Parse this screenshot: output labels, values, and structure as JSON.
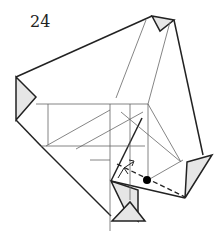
{
  "diagram": {
    "type": "origami-step",
    "step_number": "24",
    "colors": {
      "background": "#ffffff",
      "outline": "#222222",
      "crease": "#666666",
      "paper_back": "#e6e6e6",
      "marker_dot": "#000000"
    },
    "elements": [
      "outer-paper-outline",
      "left-flap",
      "top-right-flap",
      "right-flap",
      "bottom-flap",
      "crease-lines",
      "dashed-valley-fold-line",
      "fold-arrow",
      "reference-dot"
    ]
  }
}
